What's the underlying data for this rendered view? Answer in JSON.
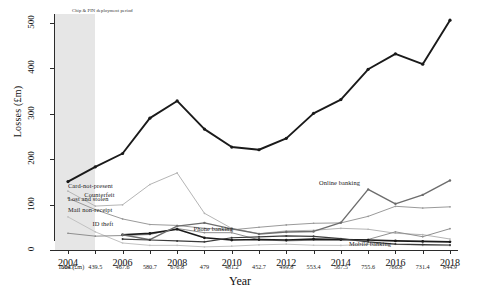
{
  "chart_data": {
    "type": "line",
    "title": "",
    "xlabel": "Year",
    "ylabel": "Losses (£m)",
    "ylim": [
      0,
      520
    ],
    "yticks": [
      0,
      100,
      200,
      300,
      400,
      500
    ],
    "xlim": [
      2004,
      2018
    ],
    "grid": false,
    "legend_position": "inline-annotations",
    "x": [
      2004,
      2005,
      2006,
      2007,
      2008,
      2009,
      2010,
      2011,
      2012,
      2013,
      2014,
      2015,
      2016,
      2017,
      2018
    ],
    "xtick_labels": [
      "2004",
      "2006",
      "2008",
      "2010",
      "2012",
      "2014",
      "2016",
      "2018"
    ],
    "xtick_values": [
      2004,
      2006,
      2008,
      2010,
      2012,
      2014,
      2016,
      2018
    ],
    "annotations": [
      {
        "text": "Chip & PIN deployment period",
        "x": 2004,
        "y": 510
      },
      {
        "text": "Card-not-present",
        "x": 2004.0,
        "y": 140
      },
      {
        "text": "Counterfeit",
        "x": 2004.6,
        "y": 122
      },
      {
        "text": "Lost and stolen",
        "x": 2004.0,
        "y": 112
      },
      {
        "text": "Mail non-receipt",
        "x": 2004.0,
        "y": 88
      },
      {
        "text": "ID theft",
        "x": 2004.9,
        "y": 58
      },
      {
        "text": "Phone banking",
        "x": 2008.6,
        "y": 47
      },
      {
        "text": "Online banking",
        "x": 2013.2,
        "y": 148
      },
      {
        "text": "Mobile banking",
        "x": 2014.3,
        "y": 14
      }
    ],
    "shaded_region": {
      "label": "Chip & PIN deployment period",
      "x_start": 2004,
      "x_end": 2005.0,
      "color": "#e6e6e6"
    },
    "series": [
      {
        "name": "Card-not-present",
        "color": "#1a1a1a",
        "width": 1.9,
        "values": [
          150.8,
          183.2,
          212.6,
          290.5,
          328.4,
          266.4,
          226.9,
          220.9,
          246.0,
          301.1,
          331.5,
          398.2,
          432.3,
          409.4,
          506.4
        ]
      },
      {
        "name": "Counterfeit",
        "color": "#b5b5b5",
        "width": 1.0,
        "values": [
          129.7,
          96.8,
          99.6,
          144.3,
          169.8,
          80.9,
          47.6,
          36.1,
          42.1,
          43.4,
          47.8,
          45.7,
          36.9,
          33.8,
          24.2
        ]
      },
      {
        "name": "Lost and stolen",
        "color": "#9a9a9a",
        "width": 1.0,
        "values": [
          114.4,
          89.0,
          68.4,
          56.2,
          54.1,
          47.9,
          44.4,
          50.1,
          55.2,
          58.9,
          59.7,
          74.1,
          96.3,
          92.5,
          95.1
        ]
      },
      {
        "name": "Mail non-receipt",
        "color": "#c2c2c2",
        "width": 1.0,
        "values": [
          72.9,
          40.0,
          15.4,
          10.2,
          10.3,
          6.9,
          8.4,
          11.3,
          12.8,
          10.5,
          10.1,
          12.5,
          12.5,
          10.1,
          9.6
        ]
      },
      {
        "name": "ID theft",
        "color": "#8f8f8f",
        "width": 1.0,
        "values": [
          36.9,
          30.5,
          31.9,
          34.1,
          47.4,
          38.2,
          38.1,
          22.5,
          20.0,
          21.6,
          21.5,
          23.2,
          40.0,
          29.3,
          47.0
        ]
      },
      {
        "name": "Phone banking",
        "color": "#1a1a1a",
        "width": 1.6,
        "values": [
          null,
          null,
          33.5,
          36.6,
          45.7,
          26.9,
          22.0,
          23.0,
          22.0,
          24.0,
          23.0,
          22.0,
          20.0,
          19.0,
          18.0
        ]
      },
      {
        "name": "Online banking",
        "color": "#6d6d6d",
        "width": 1.4,
        "values": [
          null,
          null,
          33.5,
          22.6,
          52.5,
          59.7,
          46.7,
          35.4,
          39.6,
          40.9,
          60.4,
          133.5,
          101.8,
          121.4,
          153.2
        ]
      },
      {
        "name": "Mobile banking",
        "color": "#3a3a3a",
        "width": 1.2,
        "values": [
          null,
          null,
          24.0,
          22.0,
          20.0,
          18.0,
          27.0,
          29.0,
          31.0,
          30.0,
          25.0,
          18.0,
          13.0,
          12.0,
          11.0
        ]
      }
    ],
    "totals_row": {
      "label": "Total (£m)",
      "values": [
        "504.7",
        "439.5",
        "467.6",
        "580.7",
        "676.8",
        "479",
        "481.2",
        "452.7",
        "499.8",
        "553.4",
        "567.5",
        "755.6",
        "766.8",
        "731.4",
        "844.9"
      ]
    }
  }
}
